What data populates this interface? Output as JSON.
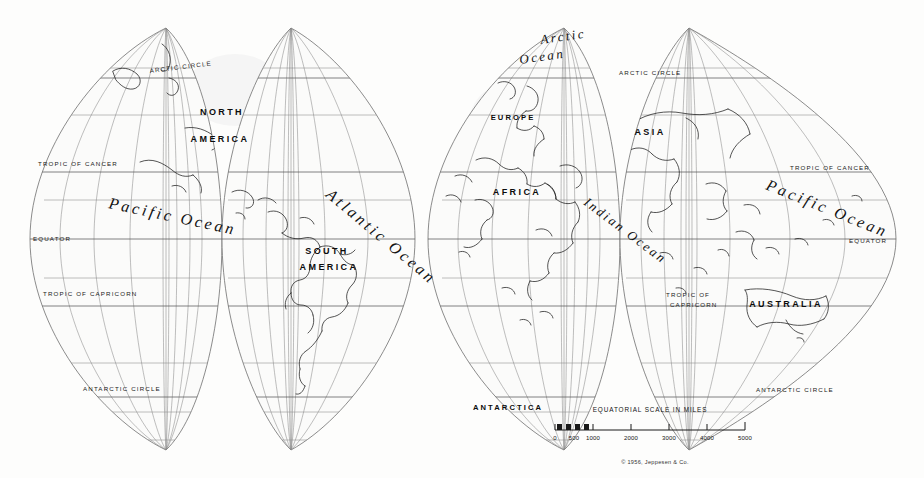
{
  "map": {
    "type": "interrupted-globular-gore-world-map",
    "projection_note": "twelve-gore interrupted globe projection, two hemispheres of six gores",
    "background_color": "#fdfdfc",
    "ink_color": "#1c1c1c",
    "graticule_color": "#8a8a8a",
    "continents": [
      {
        "name": "NORTH",
        "x": 222,
        "y": 115,
        "class": "lbl-continent"
      },
      {
        "name": "AMERICA",
        "x": 220,
        "y": 142,
        "class": "lbl-continent"
      },
      {
        "name": "SOUTH",
        "x": 327,
        "y": 254,
        "class": "lbl-continent"
      },
      {
        "name": "AMERICA",
        "x": 329,
        "y": 270,
        "class": "lbl-continent"
      },
      {
        "name": "EUROPE",
        "x": 513,
        "y": 120,
        "class": "lbl-continent-sm"
      },
      {
        "name": "ASIA",
        "x": 650,
        "y": 135,
        "class": "lbl-continent"
      },
      {
        "name": "AFRICA",
        "x": 517,
        "y": 195,
        "class": "lbl-continent"
      },
      {
        "name": "AUSTRALIA",
        "x": 786,
        "y": 307,
        "class": "lbl-continent"
      },
      {
        "name": "ANTARCTICA",
        "x": 508,
        "y": 410,
        "class": "lbl-continent-sm"
      }
    ],
    "oceans": [
      {
        "name": "Pacific Ocean",
        "x": 108,
        "y": 208,
        "rotate": 12,
        "class": "lbl-ocean"
      },
      {
        "name": "Atlantic Ocean",
        "x": 325,
        "y": 196,
        "rotate": 40,
        "class": "lbl-ocean"
      },
      {
        "name": "Indian Ocean",
        "x": 583,
        "y": 204,
        "rotate": 37,
        "class": "lbl-ocean-sm"
      },
      {
        "name": "Pacific Ocean",
        "x": 765,
        "y": 189,
        "rotate": 22,
        "class": "lbl-ocean"
      },
      {
        "name": "Arctic",
        "x": 541,
        "y": 44,
        "rotate": -8,
        "class": "lbl-ocean-sm"
      },
      {
        "name": "Ocean",
        "x": 520,
        "y": 64,
        "rotate": -8,
        "class": "lbl-ocean-sm"
      }
    ],
    "graticule_labels": [
      {
        "text": "ARCTIC CIRCLE",
        "x": 150,
        "y": 73,
        "rotate": -7
      },
      {
        "text": "TROPIC OF CANCER",
        "x": 38,
        "y": 166,
        "rotate": 0
      },
      {
        "text": "EQUATOR",
        "x": 33,
        "y": 241,
        "rotate": 0
      },
      {
        "text": "TROPIC OF CAPRICORN",
        "x": 43,
        "y": 296,
        "rotate": 0
      },
      {
        "text": "ANTARCTIC CIRCLE",
        "x": 83,
        "y": 391,
        "rotate": 0
      },
      {
        "text": "ARCTIC CIRCLE",
        "x": 619,
        "y": 75,
        "rotate": 0
      },
      {
        "text": "TROPIC OF CANCER",
        "x": 790,
        "y": 170,
        "rotate": 0
      },
      {
        "text": "EQUATOR",
        "x": 849,
        "y": 243,
        "rotate": 0
      },
      {
        "text": "TROPIC OF",
        "x": 666,
        "y": 297,
        "rotate": 0
      },
      {
        "text": "CAPRICORN",
        "x": 670,
        "y": 307,
        "rotate": 0
      },
      {
        "text": "ANTARCTIC CIRCLE",
        "x": 756,
        "y": 392,
        "rotate": 0
      }
    ],
    "scale": {
      "title": "EQUATORIAL SCALE IN MILES",
      "unit": "miles",
      "ticks": [
        "0",
        "500",
        "1000",
        "2000",
        "3000",
        "4000",
        "5000"
      ],
      "tick_values": [
        0,
        500,
        1000,
        2000,
        3000,
        4000,
        5000
      ],
      "bar_start_x": 555,
      "bar_end_x": 745,
      "bar_y": 430,
      "title_x": 650,
      "title_y": 412
    },
    "copyright": {
      "text": "© 1956, Jeppesen & Co.",
      "x": 655,
      "y": 464
    }
  }
}
